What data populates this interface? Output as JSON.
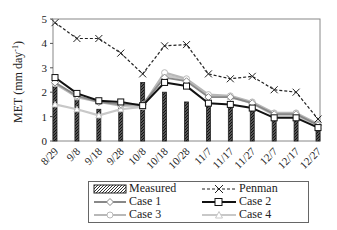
{
  "chart_data": {
    "type": "bar+line",
    "title": "",
    "xlabel": "",
    "ylabel": "MET (mm day-1)",
    "ylabel_main": "MET",
    "ylabel_unit": "(mm day",
    "ylabel_sup": "-1",
    "ylabel_close": ")",
    "ylim": [
      0,
      5
    ],
    "yticks": [
      "0",
      "1",
      "2",
      "3",
      "4",
      "5"
    ],
    "grid": false,
    "legend_position": "bottom",
    "categories": [
      "8/29",
      "9/8",
      "9/18",
      "9/28",
      "10/8",
      "10/18",
      "10/28",
      "11/7",
      "11/17",
      "11/27",
      "12/7",
      "12/17",
      "12/27"
    ],
    "series": [
      {
        "name": "Measured",
        "type": "bar",
        "values": [
          2.3,
          1.8,
          1.3,
          1.4,
          2.4,
          2.0,
          1.6,
          1.5,
          1.4,
          1.3,
          0.9,
          0.9,
          0.4
        ]
      },
      {
        "name": "Penman",
        "type": "line",
        "style": "dashed-x",
        "values": [
          4.85,
          4.2,
          4.2,
          3.6,
          2.75,
          3.9,
          3.95,
          2.75,
          2.55,
          2.65,
          2.1,
          2.0,
          0.9
        ]
      },
      {
        "name": "Case 1",
        "type": "line",
        "style": "gray-diamond",
        "values": [
          2.4,
          1.85,
          1.6,
          1.5,
          1.5,
          2.6,
          2.45,
          1.8,
          1.8,
          1.55,
          1.1,
          1.1,
          0.65
        ]
      },
      {
        "name": "Case 2",
        "type": "line",
        "style": "black-square",
        "values": [
          2.6,
          1.95,
          1.65,
          1.6,
          1.45,
          2.4,
          2.25,
          1.55,
          1.5,
          1.35,
          0.95,
          0.95,
          0.55
        ]
      },
      {
        "name": "Case 3",
        "type": "line",
        "style": "lightgray-circle",
        "values": [
          2.35,
          1.8,
          1.6,
          1.45,
          1.45,
          2.8,
          2.55,
          1.9,
          1.85,
          1.6,
          1.15,
          1.15,
          0.7
        ]
      },
      {
        "name": "Case 4",
        "type": "line",
        "style": "lightgray-triangle",
        "values": [
          1.5,
          1.3,
          1.05,
          1.3,
          1.4,
          2.7,
          2.5,
          1.85,
          1.8,
          1.55,
          1.05,
          1.05,
          0.6
        ]
      }
    ]
  },
  "legend": {
    "items": [
      "Measured",
      "Penman",
      "Case 1",
      "Case 2",
      "Case 3",
      "Case 4"
    ]
  },
  "colors": {
    "bar": "#222222",
    "penman": "#222222",
    "case1": "#888888",
    "case2": "#111111",
    "case3": "#b8b8b8",
    "case4": "#c8c8c8"
  }
}
